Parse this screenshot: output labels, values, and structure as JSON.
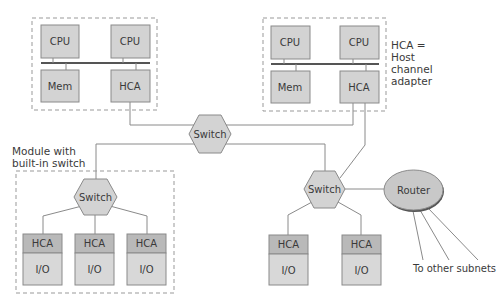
{
  "diagram": {
    "type": "network-architecture",
    "colors": {
      "box_fill": "#d3d3d3",
      "hca_fill": "#b9b9b9",
      "io_fill": "#d8d8d8",
      "border": "#8a8a8a",
      "line": "#8a8a8a",
      "bus": "#555555",
      "router_fill": "#c8c8c8",
      "text": "#3a3a3a"
    },
    "host_left": {
      "cpu1": "CPU",
      "cpu2": "CPU",
      "mem": "Mem",
      "hca": "HCA"
    },
    "host_right": {
      "cpu1": "CPU",
      "cpu2": "CPU",
      "mem": "Mem",
      "hca": "HCA"
    },
    "legend": {
      "line1": "HCA =",
      "line2": "Host",
      "line3": "channel",
      "line4": "adapter"
    },
    "central_switch": "Switch",
    "module": {
      "caption_line1": "Module with",
      "caption_line2": "built-in switch",
      "switch": "Switch",
      "devices": [
        {
          "hca": "HCA",
          "io": "I/O"
        },
        {
          "hca": "HCA",
          "io": "I/O"
        },
        {
          "hca": "HCA",
          "io": "I/O"
        }
      ]
    },
    "right_switch": "Switch",
    "right_devices": [
      {
        "hca": "HCA",
        "io": "I/O"
      },
      {
        "hca": "HCA",
        "io": "I/O"
      }
    ],
    "router": "Router",
    "subnets_label": "To other subnets"
  }
}
